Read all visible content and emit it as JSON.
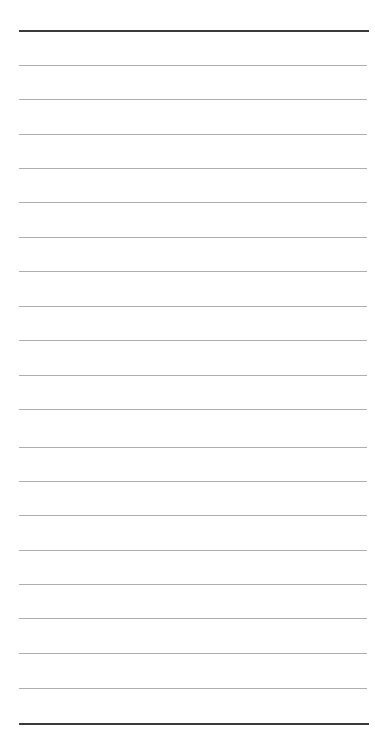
{
  "page": {
    "name": "ruled-notepaper",
    "title": "",
    "background_color": "#ffffff",
    "width": 375,
    "height": 751,
    "content_text": "",
    "is_blank": "true"
  },
  "colors": {
    "background": "#ffffff",
    "thin_rule": "#aeaeae",
    "thick_rule": "#3a3a3a"
  },
  "layout": {
    "rule_left_x": 19,
    "rule_right_x": 367,
    "rule_width": 348,
    "line_spacing": 34.3,
    "first_rule_y": 30,
    "last_rule_y": 723
  },
  "rules": [
    {
      "name": "top-border-rule",
      "y": 30,
      "weight": "thick",
      "color": "#3a3a3a",
      "text": ""
    },
    {
      "name": "rule-1",
      "y": 65,
      "weight": "thin",
      "color": "#aeaeae",
      "text": ""
    },
    {
      "name": "rule-2",
      "y": 99,
      "weight": "thin",
      "color": "#aeaeae",
      "text": ""
    },
    {
      "name": "rule-3",
      "y": 134,
      "weight": "thin",
      "color": "#aeaeae",
      "text": ""
    },
    {
      "name": "rule-4",
      "y": 168,
      "weight": "thin",
      "color": "#aeaeae",
      "text": ""
    },
    {
      "name": "rule-5",
      "y": 202,
      "weight": "thin",
      "color": "#aeaeae",
      "text": ""
    },
    {
      "name": "rule-6",
      "y": 237,
      "weight": "thin",
      "color": "#aeaeae",
      "text": ""
    },
    {
      "name": "rule-7",
      "y": 271,
      "weight": "thin",
      "color": "#aeaeae",
      "text": ""
    },
    {
      "name": "rule-8",
      "y": 306,
      "weight": "thin",
      "color": "#aeaeae",
      "text": ""
    },
    {
      "name": "rule-9",
      "y": 340,
      "weight": "thin",
      "color": "#aeaeae",
      "text": ""
    },
    {
      "name": "rule-10",
      "y": 375,
      "weight": "thin",
      "color": "#aeaeae",
      "text": ""
    },
    {
      "name": "rule-11",
      "y": 409,
      "weight": "thin",
      "color": "#aeaeae",
      "text": ""
    },
    {
      "name": "rule-12",
      "y": 447,
      "weight": "thin",
      "color": "#aeaeae",
      "text": ""
    },
    {
      "name": "rule-13",
      "y": 481,
      "weight": "thin",
      "color": "#aeaeae",
      "text": ""
    },
    {
      "name": "rule-14",
      "y": 515,
      "weight": "thin",
      "color": "#aeaeae",
      "text": ""
    },
    {
      "name": "rule-15",
      "y": 550,
      "weight": "thin",
      "color": "#aeaeae",
      "text": ""
    },
    {
      "name": "rule-16",
      "y": 584,
      "weight": "thin",
      "color": "#aeaeae",
      "text": ""
    },
    {
      "name": "rule-17",
      "y": 618,
      "weight": "thin",
      "color": "#aeaeae",
      "text": ""
    },
    {
      "name": "rule-18",
      "y": 653,
      "weight": "thin",
      "color": "#aeaeae",
      "text": ""
    },
    {
      "name": "rule-19",
      "y": 688,
      "weight": "thin",
      "color": "#aeaeae",
      "text": ""
    },
    {
      "name": "bottom-border-rule",
      "y": 723,
      "weight": "thick",
      "color": "#3a3a3a",
      "text": ""
    }
  ],
  "writing_rows": [
    {
      "name": "writing-row-1",
      "y": 31,
      "value": "",
      "placeholder": ""
    },
    {
      "name": "writing-row-2",
      "y": 66,
      "value": "",
      "placeholder": ""
    },
    {
      "name": "writing-row-3",
      "y": 100,
      "value": "",
      "placeholder": ""
    },
    {
      "name": "writing-row-4",
      "y": 135,
      "value": "",
      "placeholder": ""
    },
    {
      "name": "writing-row-5",
      "y": 169,
      "value": "",
      "placeholder": ""
    },
    {
      "name": "writing-row-6",
      "y": 203,
      "value": "",
      "placeholder": ""
    },
    {
      "name": "writing-row-7",
      "y": 238,
      "value": "",
      "placeholder": ""
    },
    {
      "name": "writing-row-8",
      "y": 272,
      "value": "",
      "placeholder": ""
    },
    {
      "name": "writing-row-9",
      "y": 307,
      "value": "",
      "placeholder": ""
    },
    {
      "name": "writing-row-10",
      "y": 341,
      "value": "",
      "placeholder": ""
    },
    {
      "name": "writing-row-11",
      "y": 376,
      "value": "",
      "placeholder": ""
    },
    {
      "name": "writing-row-12",
      "y": 410,
      "value": "",
      "placeholder": ""
    },
    {
      "name": "writing-row-13",
      "y": 448,
      "value": "",
      "placeholder": ""
    },
    {
      "name": "writing-row-14",
      "y": 482,
      "value": "",
      "placeholder": ""
    },
    {
      "name": "writing-row-15",
      "y": 516,
      "value": "",
      "placeholder": ""
    },
    {
      "name": "writing-row-16",
      "y": 551,
      "value": "",
      "placeholder": ""
    },
    {
      "name": "writing-row-17",
      "y": 585,
      "value": "",
      "placeholder": ""
    },
    {
      "name": "writing-row-18",
      "y": 619,
      "value": "",
      "placeholder": ""
    },
    {
      "name": "writing-row-19",
      "y": 654,
      "value": "",
      "placeholder": ""
    },
    {
      "name": "writing-row-20",
      "y": 689,
      "value": "",
      "placeholder": ""
    }
  ]
}
